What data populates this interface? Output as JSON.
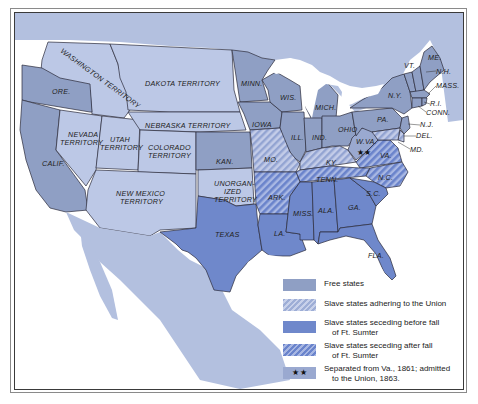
{
  "map": {
    "colors": {
      "ocean_background": "#ffffff",
      "foreign_land": "#b3c0df",
      "territory": "#bcc8e6",
      "free_state": "#8f9fc4",
      "slave_adhering": "#9eaed6",
      "seceding_before": "#6f88cb",
      "seceding_after": "#7b92d0",
      "border": "#2a2a3a"
    },
    "labels": {
      "washington": "WASHINGTON TERRITORY",
      "dakota": "DAKOTA TERRITORY",
      "ore": "ORE.",
      "nebraska": "NEBRASKA TERRITORY",
      "nevada_1": "NEVADA",
      "nevada_2": "TERRITORY",
      "utah_1": "UTAH",
      "utah_2": "TERRITORY",
      "colorado_1": "COLORADO",
      "colorado_2": "TERRITORY",
      "calif": "CALIF.",
      "kan": "KAN.",
      "newmexico_1": "NEW MEXICO",
      "newmexico_2": "TERRITORY",
      "unorg_1": "UNORGAN-",
      "unorg_2": "IZED",
      "unorg_3": "TERRITORY",
      "texas": "TEXAS",
      "minn": "MINN.",
      "wis": "WIS.",
      "mich": "MICH.",
      "iowa": "IOWA",
      "ill": "ILL.",
      "ind": "IND.",
      "ohio": "OHIO",
      "mo": "MO.",
      "ky": "KY.",
      "wva": "W.VA.",
      "va": "VA.",
      "tenn": "TENN.",
      "nc": "N.C.",
      "sc": "S.C.",
      "ark": "ARK.",
      "miss": "MISS.",
      "ala": "ALA.",
      "ga": "GA.",
      "la": "LA.",
      "fla": "FLA.",
      "ny": "N.Y.",
      "pa": "PA.",
      "vt": "VT.",
      "me": "ME.",
      "nh": "N.H.",
      "mass": "MASS.",
      "ri": "R.I.",
      "conn": "CONN.",
      "nj": "N.J.",
      "del": "DEL.",
      "md": "MD."
    },
    "wva_stars": "★★"
  },
  "legend": {
    "items": [
      {
        "label_1": "Free states",
        "label_2": "",
        "pattern": "free"
      },
      {
        "label_1": "Slave states adhering to the Union",
        "label_2": "",
        "pattern": "adhering"
      },
      {
        "label_1": "Slave states seceding before fall",
        "label_2": "of Ft. Sumter",
        "pattern": "before"
      },
      {
        "label_1": "Slave states seceding after fall",
        "label_2": "of Ft. Sumter",
        "pattern": "after"
      },
      {
        "label_1": "Separated from Va., 1861; admitted",
        "label_2": "to the Union, 1863.",
        "pattern": "stars",
        "symbol": "★★"
      }
    ]
  }
}
